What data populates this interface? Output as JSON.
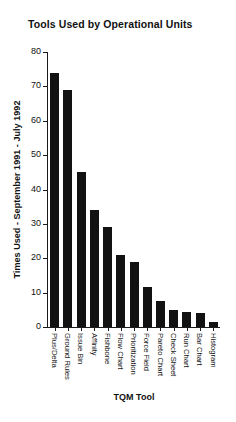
{
  "chart_data": {
    "type": "bar",
    "title": "Tools Used by Operational Units",
    "xlabel": "TQM Tool",
    "ylabel": "Times Used - September 1991 - July 1992",
    "ylim": [
      0,
      80
    ],
    "ytick_step": 10,
    "yticks": [
      0,
      10,
      20,
      30,
      40,
      50,
      60,
      70,
      80
    ],
    "grid": false,
    "legend": null,
    "bar_color": "#121212",
    "categories": [
      "Plus/Delta",
      "Ground Rules",
      "Issue Bin",
      "Affinity",
      "Fishbone",
      "Flow Chart",
      "Prioritization",
      "Force Field",
      "Pareto Chart",
      "Check Sheet",
      "Run Chart",
      "Bar Chart",
      "Histogram"
    ],
    "values": [
      74,
      69,
      45,
      34,
      29,
      21,
      19,
      11.5,
      7.5,
      5,
      4.5,
      4,
      1.5
    ]
  }
}
